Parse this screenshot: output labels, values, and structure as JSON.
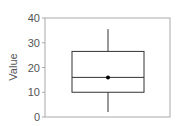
{
  "chart_data": {
    "type": "box",
    "title": "",
    "xlabel": "",
    "ylabel": "Value",
    "ylim": [
      0,
      40
    ],
    "yticks": [
      0,
      10,
      20,
      30,
      40
    ],
    "grid": false,
    "legend": null,
    "series": [
      {
        "name": "",
        "whisker_low": 2,
        "q1": 10,
        "median": 16,
        "q3": 26.5,
        "whisker_high": 35.5,
        "mean": 16
      }
    ]
  },
  "colors": {
    "axis": "#999999",
    "box": "#333333",
    "text": "#555555",
    "mean_marker": "#000000"
  }
}
